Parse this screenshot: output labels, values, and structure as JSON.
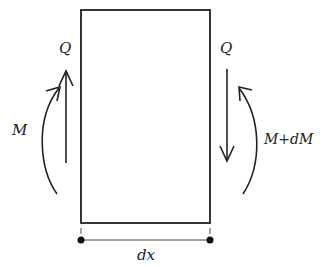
{
  "diagram": {
    "colors": {
      "stroke": "#222222",
      "background": "#ffffff"
    },
    "element": {
      "type": "rectangle",
      "x": 81,
      "y": 10,
      "width": 129,
      "height": 213
    },
    "labels": {
      "q_left": "Q",
      "q_right": "Q",
      "m_left": "M",
      "m_right": "M+dM",
      "width": "dx"
    },
    "forces": [
      {
        "name": "Q",
        "side": "left",
        "direction": "up"
      },
      {
        "name": "Q",
        "side": "right",
        "direction": "down"
      }
    ],
    "moments": [
      {
        "name": "M",
        "side": "left",
        "sense": "counterclockwise-arc-up"
      },
      {
        "name": "M+dM",
        "side": "right",
        "sense": "clockwise-arc-up"
      }
    ],
    "dimension": {
      "label": "dx",
      "from_x": 81,
      "to_x": 210,
      "y": 240
    }
  }
}
